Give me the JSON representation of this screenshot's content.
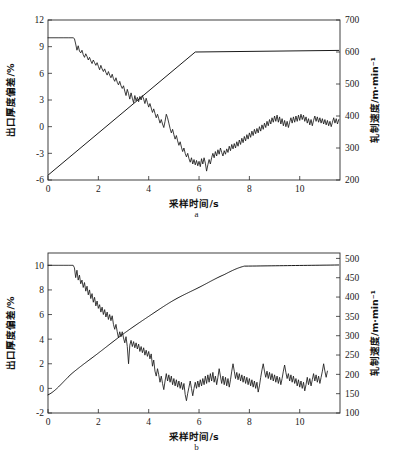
{
  "figure": {
    "background_color": "#ffffff",
    "line_color": "#1a1a1a"
  },
  "chart_data": [
    {
      "id": "a",
      "type": "line",
      "title": "",
      "subcaption": "a",
      "xlabel": "采样时间/s",
      "ylabel": "出口厚度偏差/%",
      "y2label": "轧制速度/m·min⁻¹",
      "xlim": [
        0,
        11.6
      ],
      "xticks": [
        0,
        2,
        4,
        6,
        8,
        10
      ],
      "xticklabels": [
        "0",
        "2",
        "4",
        "6",
        "8",
        "10"
      ],
      "ylim": [
        -6,
        12
      ],
      "yticks": [
        -6,
        -3,
        0,
        3,
        6,
        9,
        12
      ],
      "yticklabels": [
        "-6",
        "-3",
        "0",
        "3",
        "6",
        "9",
        "12"
      ],
      "y2lim": [
        200,
        700
      ],
      "y2ticks": [
        200,
        300,
        400,
        500,
        600,
        700
      ],
      "y2ticklabels": [
        "200",
        "300",
        "400",
        "500",
        "600",
        "700"
      ],
      "grid": false,
      "legend": "none",
      "series": [
        {
          "name": "出口厚度偏差",
          "axis": "left",
          "x": [
            0.0,
            0.2,
            0.4,
            0.6,
            0.8,
            1.0,
            1.05,
            1.1,
            1.15,
            1.2,
            1.25,
            1.3,
            1.35,
            1.4,
            1.45,
            1.5,
            1.55,
            1.6,
            1.65,
            1.7,
            1.75,
            1.8,
            1.85,
            1.9,
            1.95,
            2.0,
            2.05,
            2.1,
            2.15,
            2.2,
            2.25,
            2.3,
            2.35,
            2.4,
            2.45,
            2.5,
            2.55,
            2.6,
            2.65,
            2.7,
            2.75,
            2.8,
            2.85,
            2.9,
            2.95,
            3.0,
            3.05,
            3.1,
            3.15,
            3.2,
            3.25,
            3.3,
            3.35,
            3.4,
            3.45,
            3.5,
            3.55,
            3.6,
            3.65,
            3.7,
            3.75,
            3.8,
            3.85,
            3.9,
            3.95,
            4.0,
            4.05,
            4.1,
            4.15,
            4.2,
            4.25,
            4.3,
            4.35,
            4.4,
            4.45,
            4.5,
            4.55,
            4.6,
            4.65,
            4.7,
            4.75,
            4.8,
            4.85,
            4.9,
            4.95,
            5.0,
            5.05,
            5.1,
            5.15,
            5.2,
            5.25,
            5.3,
            5.35,
            5.4,
            5.45,
            5.5,
            5.55,
            5.6,
            5.65,
            5.7,
            5.75,
            5.8,
            5.85,
            5.9,
            5.95,
            6.0,
            6.05,
            6.1,
            6.15,
            6.2,
            6.25,
            6.3,
            6.35,
            6.4,
            6.45,
            6.5,
            6.55,
            6.6,
            6.65,
            6.7,
            6.75,
            6.8,
            6.85,
            6.9,
            6.95,
            7.0,
            7.05,
            7.1,
            7.15,
            7.2,
            7.25,
            7.3,
            7.35,
            7.4,
            7.45,
            7.5,
            7.55,
            7.6,
            7.65,
            7.7,
            7.75,
            7.8,
            7.85,
            7.9,
            7.95,
            8.0,
            8.05,
            8.1,
            8.15,
            8.2,
            8.25,
            8.3,
            8.35,
            8.4,
            8.45,
            8.5,
            8.55,
            8.6,
            8.65,
            8.7,
            8.75,
            8.8,
            8.85,
            8.9,
            8.95,
            9.0,
            9.05,
            9.1,
            9.15,
            9.2,
            9.25,
            9.3,
            9.35,
            9.4,
            9.45,
            9.5,
            9.55,
            9.6,
            9.65,
            9.7,
            9.75,
            9.8,
            9.85,
            9.9,
            9.95,
            10.0,
            10.05,
            10.1,
            10.15,
            10.2,
            10.25,
            10.3,
            10.35,
            10.4,
            10.45,
            10.5,
            10.55,
            10.6,
            10.65,
            10.7,
            10.75,
            10.8,
            10.85,
            10.9,
            10.95,
            11.0,
            11.05,
            11.1,
            11.15,
            11.2,
            11.25,
            11.3,
            11.35,
            11.4,
            11.45,
            11.5,
            11.55
          ],
          "y": [
            10.0,
            10.0,
            10.0,
            10.0,
            10.0,
            10.0,
            9.9,
            9.3,
            8.6,
            9.1,
            8.5,
            8.3,
            8.6,
            8.1,
            7.8,
            8.2,
            7.9,
            7.5,
            7.8,
            7.4,
            7.1,
            7.5,
            7.2,
            6.9,
            7.2,
            6.8,
            6.4,
            6.9,
            6.5,
            6.2,
            6.5,
            6.1,
            5.8,
            6.2,
            5.8,
            5.5,
            5.9,
            5.4,
            5.1,
            5.5,
            5.0,
            4.7,
            5.1,
            4.6,
            4.3,
            4.6,
            4.0,
            3.5,
            4.2,
            3.7,
            3.1,
            3.8,
            3.2,
            2.7,
            3.5,
            2.9,
            3.3,
            2.8,
            3.4,
            3.0,
            3.5,
            3.1,
            2.6,
            3.2,
            2.7,
            2.2,
            2.6,
            2.1,
            1.6,
            2.0,
            1.5,
            1.0,
            1.4,
            0.9,
            0.4,
            0.8,
            0.3,
            -0.1,
            0.6,
            1.4,
            1.0,
            0.4,
            -0.2,
            -0.7,
            -0.3,
            -0.9,
            -1.4,
            -1.0,
            -1.6,
            -2.1,
            -1.7,
            -2.3,
            -2.8,
            -2.4,
            -3.0,
            -3.4,
            -3.0,
            -3.6,
            -4.0,
            -3.5,
            -4.2,
            -3.7,
            -4.3,
            -3.8,
            -4.4,
            -3.9,
            -4.5,
            -3.6,
            -4.2,
            -3.5,
            -4.1,
            -5.0,
            -4.3,
            -3.7,
            -4.2,
            -3.5,
            -3.0,
            -3.5,
            -2.8,
            -3.3,
            -2.6,
            -3.1,
            -2.4,
            -2.9,
            -3.3,
            -2.7,
            -3.1,
            -2.5,
            -2.9,
            -2.2,
            -2.7,
            -2.0,
            -2.5,
            -1.9,
            -2.4,
            -1.7,
            -2.2,
            -1.5,
            -2.0,
            -1.3,
            -1.8,
            -1.1,
            -1.6,
            -0.9,
            -1.4,
            -0.7,
            -1.2,
            -0.5,
            -1.0,
            -0.3,
            -0.8,
            -0.2,
            -0.7,
            0.0,
            -0.5,
            0.2,
            -0.3,
            0.4,
            -0.1,
            0.6,
            0.1,
            0.8,
            0.3,
            1.0,
            0.5,
            1.2,
            0.6,
            1.3,
            0.5,
            1.1,
            0.3,
            0.9,
            0.1,
            0.7,
            0.0,
            0.6,
            -0.1,
            0.5,
            1.0,
            0.4,
            1.1,
            0.5,
            1.2,
            0.6,
            1.3,
            0.7,
            1.4,
            0.8,
            1.3,
            0.6,
            1.1,
            0.4,
            0.9,
            0.2,
            0.8,
            0.1,
            0.7,
            1.2,
            0.6,
            1.1,
            0.5,
            1.0,
            0.4,
            0.9,
            0.3,
            0.8,
            0.2,
            0.7,
            0.1,
            0.6,
            0.0,
            0.5,
            1.0,
            0.4,
            0.9,
            0.3,
            0.8,
            0.2,
            0.7,
            1.2,
            0.6,
            1.1,
            1.6
          ]
        },
        {
          "name": "轧制速度",
          "axis": "right",
          "shape": "linear-ramp",
          "x": [
            0.0,
            5.85,
            11.55
          ],
          "y": [
            215,
            600,
            605
          ]
        }
      ]
    },
    {
      "id": "b",
      "type": "line",
      "title": "",
      "subcaption": "b",
      "xlabel": "采样时间/s",
      "ylabel": "出口厚度偏差/%",
      "y2label": "轧制速度/m·min⁻¹",
      "xlim": [
        0,
        11.6
      ],
      "xticks": [
        0,
        2,
        4,
        6,
        8,
        10
      ],
      "xticklabels": [
        "0",
        "2",
        "4",
        "6",
        "8",
        "10"
      ],
      "ylim": [
        -2,
        11
      ],
      "yticks": [
        -2,
        0,
        2,
        4,
        6,
        8,
        10
      ],
      "yticklabels": [
        "-2",
        "0",
        "2",
        "4",
        "6",
        "8",
        "10"
      ],
      "y2lim": [
        100,
        514
      ],
      "y2ticks": [
        100,
        150,
        200,
        250,
        300,
        350,
        400,
        450,
        500
      ],
      "y2ticklabels": [
        "100",
        "150",
        "200",
        "250",
        "300",
        "350",
        "400",
        "450",
        "500"
      ],
      "grid": false,
      "legend": "none",
      "series": [
        {
          "name": "出口厚度偏差",
          "axis": "left",
          "x": [
            0.0,
            0.2,
            0.4,
            0.6,
            0.8,
            1.0,
            1.05,
            1.1,
            1.15,
            1.2,
            1.25,
            1.3,
            1.35,
            1.4,
            1.45,
            1.5,
            1.55,
            1.6,
            1.65,
            1.7,
            1.75,
            1.8,
            1.85,
            1.9,
            1.95,
            2.0,
            2.05,
            2.1,
            2.15,
            2.2,
            2.25,
            2.3,
            2.35,
            2.4,
            2.45,
            2.5,
            2.55,
            2.6,
            2.65,
            2.7,
            2.75,
            2.8,
            2.85,
            2.9,
            2.95,
            3.0,
            3.05,
            3.1,
            3.15,
            3.2,
            3.25,
            3.3,
            3.35,
            3.4,
            3.45,
            3.5,
            3.55,
            3.6,
            3.65,
            3.7,
            3.75,
            3.8,
            3.85,
            3.9,
            3.95,
            4.0,
            4.05,
            4.1,
            4.15,
            4.2,
            4.25,
            4.3,
            4.35,
            4.4,
            4.45,
            4.5,
            4.55,
            4.6,
            4.65,
            4.7,
            4.75,
            4.8,
            4.85,
            4.9,
            4.95,
            5.0,
            5.05,
            5.1,
            5.15,
            5.2,
            5.25,
            5.3,
            5.35,
            5.4,
            5.45,
            5.5,
            5.55,
            5.6,
            5.65,
            5.7,
            5.75,
            5.8,
            5.85,
            5.9,
            5.95,
            6.0,
            6.05,
            6.1,
            6.15,
            6.2,
            6.25,
            6.3,
            6.35,
            6.4,
            6.45,
            6.5,
            6.55,
            6.6,
            6.65,
            6.7,
            6.75,
            6.8,
            6.85,
            6.9,
            6.95,
            7.0,
            7.05,
            7.1,
            7.15,
            7.2,
            7.25,
            7.3,
            7.35,
            7.4,
            7.45,
            7.5,
            7.55,
            7.6,
            7.65,
            7.7,
            7.75,
            7.8,
            7.85,
            7.9,
            7.95,
            8.0,
            8.05,
            8.1,
            8.15,
            8.2,
            8.25,
            8.3,
            8.35,
            8.4,
            8.45,
            8.5,
            8.55,
            8.6,
            8.65,
            8.7,
            8.75,
            8.8,
            8.85,
            8.9,
            8.95,
            9.0,
            9.05,
            9.1,
            9.15,
            9.2,
            9.25,
            9.3,
            9.35,
            9.4,
            9.45,
            9.5,
            9.55,
            9.6,
            9.65,
            9.7,
            9.75,
            9.8,
            9.85,
            9.9,
            9.95,
            10.0,
            10.05,
            10.1,
            10.15,
            10.2,
            10.25,
            10.3,
            10.35,
            10.4,
            10.45,
            10.5,
            10.55,
            10.6,
            10.65,
            10.7,
            10.75,
            10.8,
            10.85,
            10.9,
            10.95,
            11.0,
            11.05,
            11.1,
            11.15,
            11.2,
            11.25,
            11.3,
            11.35,
            11.4,
            11.45,
            11.5,
            11.55
          ],
          "y": [
            10.0,
            10.0,
            10.0,
            10.0,
            10.0,
            10.0,
            9.8,
            9.0,
            9.6,
            8.8,
            9.2,
            8.5,
            8.8,
            8.2,
            8.6,
            7.9,
            8.3,
            7.6,
            8.0,
            7.3,
            7.7,
            7.0,
            7.4,
            6.7,
            7.1,
            6.5,
            6.8,
            6.2,
            6.6,
            6.0,
            6.4,
            5.8,
            6.2,
            5.6,
            6.0,
            5.5,
            5.9,
            5.2,
            4.8,
            5.2,
            4.6,
            4.1,
            4.6,
            4.2,
            4.6,
            4.1,
            3.7,
            4.2,
            3.4,
            2.0,
            3.5,
            3.9,
            3.4,
            3.8,
            3.3,
            3.7,
            3.2,
            3.6,
            3.0,
            3.4,
            2.9,
            3.3,
            2.7,
            3.1,
            2.6,
            3.0,
            2.4,
            2.8,
            1.8,
            2.3,
            1.4,
            1.0,
            1.6,
            1.1,
            0.5,
            1.0,
            0.4,
            -0.1,
            0.6,
            1.2,
            0.6,
            1.1,
            0.5,
            1.0,
            0.3,
            0.8,
            0.2,
            0.7,
            0.1,
            0.6,
            0.0,
            0.5,
            -0.1,
            0.4,
            -0.5,
            -1.0,
            -0.4,
            0.1,
            0.6,
            0.0,
            -0.6,
            0.0,
            0.5,
            0.0,
            0.6,
            0.1,
            0.7,
            0.2,
            0.8,
            0.3,
            1.0,
            0.4,
            1.1,
            0.5,
            1.2,
            0.6,
            1.3,
            0.5,
            1.0,
            0.3,
            0.9,
            1.6,
            1.0,
            0.4,
            1.0,
            0.3,
            0.9,
            0.2,
            0.8,
            0.1,
            0.7,
            1.4,
            2.0,
            1.4,
            0.8,
            1.3,
            0.7,
            1.2,
            0.6,
            1.1,
            0.5,
            1.0,
            0.4,
            0.9,
            0.3,
            0.8,
            0.2,
            0.7,
            0.1,
            0.6,
            0.0,
            0.5,
            -0.3,
            0.2,
            0.9,
            1.5,
            2.0,
            1.4,
            0.9,
            1.4,
            0.8,
            1.3,
            0.7,
            1.2,
            0.6,
            1.1,
            0.5,
            1.0,
            0.4,
            0.9,
            0.3,
            0.8,
            1.4,
            1.9,
            1.3,
            0.8,
            1.2,
            0.6,
            1.1,
            0.5,
            1.0,
            0.4,
            0.8,
            0.2,
            0.7,
            0.1,
            0.6,
            0.0,
            0.5,
            -0.2,
            0.3,
            0.9,
            0.3,
            0.8,
            0.2,
            0.7,
            1.2,
            0.6,
            1.1,
            0.5,
            1.0,
            0.4,
            0.9,
            1.4,
            2.0,
            1.4,
            0.9,
            1.4
          ]
        },
        {
          "name": "轧制速度",
          "axis": "right",
          "shape": "curved-ramp",
          "x": [
            0.0,
            1.0,
            2.0,
            3.0,
            4.0,
            5.0,
            6.0,
            7.0,
            7.8,
            11.55
          ],
          "y": [
            147,
            205,
            255,
            305,
            350,
            392,
            425,
            458,
            480,
            483
          ]
        }
      ]
    }
  ]
}
